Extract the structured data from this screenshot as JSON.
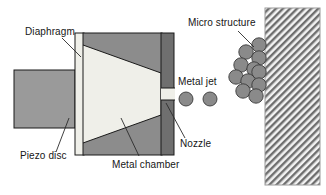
{
  "figure": {
    "type": "schematic-diagram",
    "background_color": "#ffffff",
    "width": 326,
    "height": 195
  },
  "labels": {
    "diaphragm": "Diaphragm",
    "piezo_disc": "Piezo disc",
    "metal_chamber": "Metal chamber",
    "nozzle": "Nozzle",
    "metal_jet": "Metal jet",
    "micro_structure": "Micro structure"
  },
  "colors": {
    "outline": "#1a1a1a",
    "chamber_fill": "#efefe9",
    "body_gray": "#8c8c8c",
    "wall_dark_gray": "#6f6f6f",
    "piezo_gray": "#9a9a9a",
    "droplet_gray": "#8a8a8a",
    "substrate_hatch": "#6e6e6e",
    "substrate_bg": "#f2f2f2",
    "leader_line": "#2b2b2b",
    "text": "#161616"
  },
  "parts": {
    "piezo_disc": {
      "shape": "rectangle",
      "x": 14,
      "y": 70,
      "width": 61,
      "height": 58,
      "fill": "#9a9a9a"
    },
    "diaphragm": {
      "shape": "vertical-strip",
      "x": 75,
      "y": 33,
      "width": 8,
      "height": 122,
      "fill": "#efefe9"
    },
    "chamber_body": {
      "shape": "rectangle",
      "x": 83,
      "y": 33,
      "width": 78,
      "height": 122,
      "fill": "#8c8c8c"
    },
    "metal_chamber_cavity": {
      "shape": "tapered-wedge",
      "fill": "#efefe9",
      "note": "converging cavity narrowing toward the nozzle"
    },
    "nozzle_wall": {
      "shape": "vertical-bar",
      "x": 161,
      "y": 33,
      "width": 13,
      "height": 122,
      "fill": "#6f6f6f"
    },
    "nozzle_orifice": {
      "shape": "gap",
      "x": 161,
      "y": 88,
      "width": 13,
      "height": 12,
      "fill": "#efefe9"
    },
    "substrate": {
      "shape": "hatched-rectangle",
      "x": 265,
      "y": 8,
      "width": 55,
      "height": 177
    }
  },
  "metal_jet_droplets": [
    {
      "cx": 186,
      "cy": 99,
      "r": 7
    },
    {
      "cx": 210,
      "cy": 99,
      "r": 7
    }
  ],
  "micro_structure_droplets": [
    {
      "cx": 259,
      "cy": 45,
      "r": 7
    },
    {
      "cx": 247,
      "cy": 52,
      "r": 7
    },
    {
      "cx": 259,
      "cy": 58,
      "r": 7
    },
    {
      "cx": 242,
      "cy": 64,
      "r": 7
    },
    {
      "cx": 255,
      "cy": 69,
      "r": 7
    },
    {
      "cx": 236,
      "cy": 76,
      "r": 7
    },
    {
      "cx": 249,
      "cy": 80,
      "r": 7
    },
    {
      "cx": 259,
      "cy": 72,
      "r": 7
    },
    {
      "cx": 259,
      "cy": 85,
      "r": 7
    },
    {
      "cx": 244,
      "cy": 90,
      "r": 7
    },
    {
      "cx": 257,
      "cy": 96,
      "r": 7
    }
  ],
  "leader_lines": [
    {
      "name": "diaphragm-leader",
      "from": [
        62,
        38
      ],
      "to": [
        80,
        55
      ]
    },
    {
      "name": "piezo-disc-leader",
      "from": [
        57,
        155
      ],
      "to": [
        68,
        120
      ]
    },
    {
      "name": "metal-chamber-leader",
      "from": [
        140,
        158
      ],
      "to": [
        120,
        120
      ]
    },
    {
      "name": "nozzle-leader",
      "from": [
        186,
        140
      ],
      "to": [
        166,
        104
      ]
    },
    {
      "name": "micro-structure-leader",
      "from": [
        240,
        32
      ],
      "to": [
        254,
        46
      ]
    }
  ]
}
